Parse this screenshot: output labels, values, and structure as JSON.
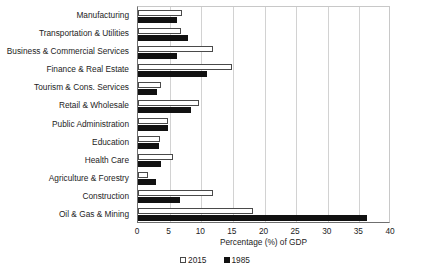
{
  "chart_data": {
    "type": "bar",
    "orientation": "horizontal",
    "title": "",
    "xlabel": "Percentage (%) of GDP",
    "ylabel": "",
    "xlim": [
      0,
      40
    ],
    "xticks": [
      0,
      5,
      10,
      15,
      20,
      25,
      30,
      35,
      40
    ],
    "grid": true,
    "legend_position": "bottom-center",
    "categories": [
      "Manufacturing",
      "Transportation & Utilities",
      "Business & Commercial Services",
      "Finance & Real Estate",
      "Tourism & Cons. Services",
      "Retail & Wholesale",
      "Public Administration",
      "Education",
      "Health Care",
      "Agriculture & Forestry",
      "Construction",
      "Oil & Gas & Mining"
    ],
    "series": [
      {
        "name": "2015",
        "color": "#ffffff",
        "edge_color": "#4a4a4a",
        "values": [
          6.9,
          6.8,
          11.9,
          14.9,
          3.7,
          9.7,
          4.8,
          3.4,
          5.6,
          1.6,
          11.9,
          18.2
        ]
      },
      {
        "name": "1985",
        "color": "#111111",
        "edge_color": "#111111",
        "values": [
          6.2,
          7.9,
          6.1,
          10.9,
          3.0,
          8.4,
          4.8,
          3.3,
          3.6,
          2.9,
          6.6,
          36.2
        ]
      }
    ]
  }
}
